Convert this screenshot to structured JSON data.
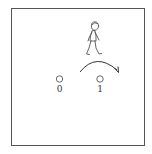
{
  "scene": {
    "description": "A walking person above two positions with a curved arrow from position 0 toward position 1",
    "positions": [
      {
        "label": "0"
      },
      {
        "label": "1"
      }
    ],
    "figure": "walking-person",
    "arrow": "curved-arrow-right"
  }
}
